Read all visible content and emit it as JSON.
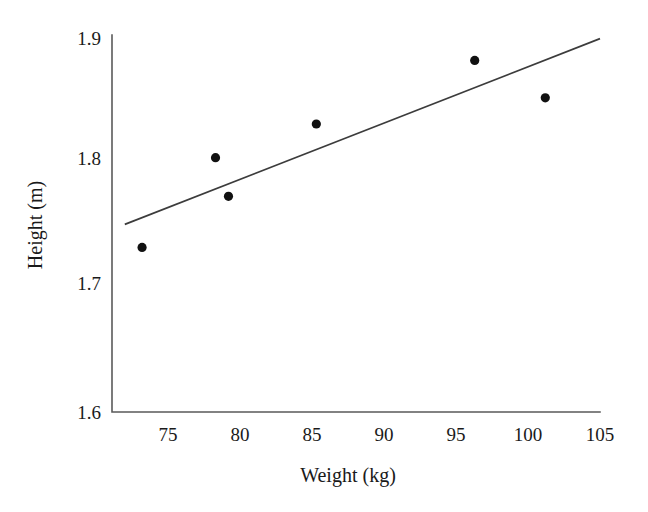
{
  "chart_data": {
    "type": "scatter",
    "title": "",
    "xlabel": "Weight (kg)",
    "ylabel": "Height (m)",
    "xlim": [
      72,
      105
    ],
    "ylim": [
      1.6,
      1.9
    ],
    "xticks": [
      75,
      80,
      85,
      90,
      95,
      100,
      105
    ],
    "xtick_labels": [
      "75",
      "80",
      "85",
      "90",
      "95",
      "100",
      "105"
    ],
    "yticks": [
      1.6,
      1.7,
      1.8,
      1.9
    ],
    "ytick_labels": [
      "1.6",
      "1.7",
      "1.8",
      "1.9"
    ],
    "grid": false,
    "legend": null,
    "marker_color": "#111111",
    "line_color": "#3c3c3c",
    "axis_color": "#5a5a5a",
    "points": [
      {
        "x": 73.2,
        "y": 1.732
      },
      {
        "x": 78.3,
        "y": 1.804
      },
      {
        "x": 79.2,
        "y": 1.773
      },
      {
        "x": 85.3,
        "y": 1.831
      },
      {
        "x": 96.3,
        "y": 1.882
      },
      {
        "x": 101.2,
        "y": 1.852
      }
    ],
    "series": [
      {
        "name": "observations",
        "x": [
          73.2,
          78.3,
          79.2,
          85.3,
          96.3,
          101.2
        ],
        "values": [
          1.732,
          1.804,
          1.773,
          1.831,
          1.882,
          1.852
        ]
      }
    ],
    "trendline": {
      "type": "linear",
      "x_start": 72.0,
      "y_start": 1.7505,
      "x_end": 105.0,
      "y_end": 1.8995
    }
  },
  "axes": {
    "x_label": "Weight (kg)",
    "y_label": "Height (m)"
  }
}
